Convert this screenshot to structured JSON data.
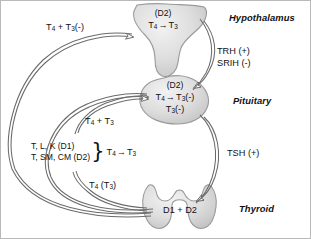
{
  "figure": {
    "colors": {
      "organ_fill": "#d8d8d8",
      "organ_stroke": "#8a8a8a",
      "arrow_stroke": "#5a5a5a",
      "text": "#111111",
      "background": "#ffffff",
      "border": "#b9b9b9"
    }
  },
  "organs": {
    "hypothalamus": {
      "name": "Hypothalamus",
      "label": "Hypothalamus",
      "inner_enzyme": "(D2)",
      "inner_reaction_t4": "T",
      "inner_reaction_t4_sub": "4",
      "inner_reaction_arrow": "→",
      "inner_reaction_t3": "T",
      "inner_reaction_t3_sub": "3"
    },
    "pituitary": {
      "name": "Pituitary",
      "label": "Pituitary",
      "inner_enzyme": "(D2)",
      "inner_reaction_t4": "T",
      "inner_reaction_t4_sub": "4",
      "inner_reaction_arrow": "→",
      "inner_reaction_t3": "T",
      "inner_reaction_t3_sub": "3",
      "inner_reaction_sign": "(-)",
      "inner_second_t3": "T",
      "inner_second_t3_sub": "3",
      "inner_second_sign": "(-)"
    },
    "thyroid": {
      "name": "Thyroid",
      "label": "Thyroid",
      "inner_enzymes": "D1 + D2"
    }
  },
  "annotations": {
    "feedback_hypothalamus": {
      "t4": "T",
      "t4_sub": "4",
      "plus": "+",
      "t3": "T",
      "t3_sub": "3",
      "sign": "(-)"
    },
    "feedback_pituitary": {
      "t4": "T",
      "t4_sub": "4",
      "plus": "+",
      "t3": "T",
      "t3_sub": "3"
    },
    "trh": "TRH (+)",
    "srih": "SRIH (-)",
    "tsh": "TSH (+)",
    "thyroid_output": {
      "t4": "T",
      "t4_sub": "4",
      "open_paren": "(",
      "t3": "T",
      "t3_sub": "3",
      "close_paren": ")"
    },
    "peripheral_tissues": {
      "line1": "T, L, K (D1)",
      "line2": "T, SM, CM (D2)",
      "brace": "}",
      "reaction_t4": "T",
      "reaction_t4_sub": "4",
      "reaction_arrow": "→",
      "reaction_t3": "T",
      "reaction_t3_sub": "3"
    }
  }
}
